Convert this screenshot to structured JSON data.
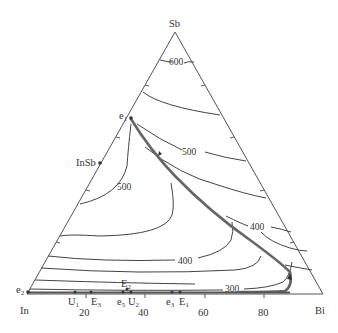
{
  "diagram": {
    "type": "ternary-liquidus-projection",
    "system": "In-Sb-Bi",
    "vertices": {
      "top": "Sb",
      "left": "In",
      "right": "Bi"
    },
    "bottom_axis_ticks": [
      "20",
      "40",
      "60",
      "80"
    ],
    "compound_label": "InSb",
    "isotherm_labels": [
      "600",
      "500",
      "500",
      "400",
      "400",
      "300"
    ],
    "invariant_points": {
      "e1": {
        "base": "e",
        "sub": "1"
      },
      "e2": {
        "base": "e",
        "sub": "2"
      },
      "e3": {
        "base": "e",
        "sub": "3"
      },
      "e5": {
        "base": "e",
        "sub": "5"
      },
      "E1": {
        "base": "E",
        "sub": "1"
      },
      "E2": {
        "base": "E",
        "sub": "2"
      },
      "E3": {
        "base": "E",
        "sub": "3"
      },
      "U1": {
        "base": "U",
        "sub": "1"
      },
      "U2": {
        "base": "U",
        "sub": "2"
      }
    },
    "colors": {
      "edge": "#555555",
      "isotherm": "#444444",
      "monovariant": "#666666",
      "text": "#333333"
    }
  }
}
